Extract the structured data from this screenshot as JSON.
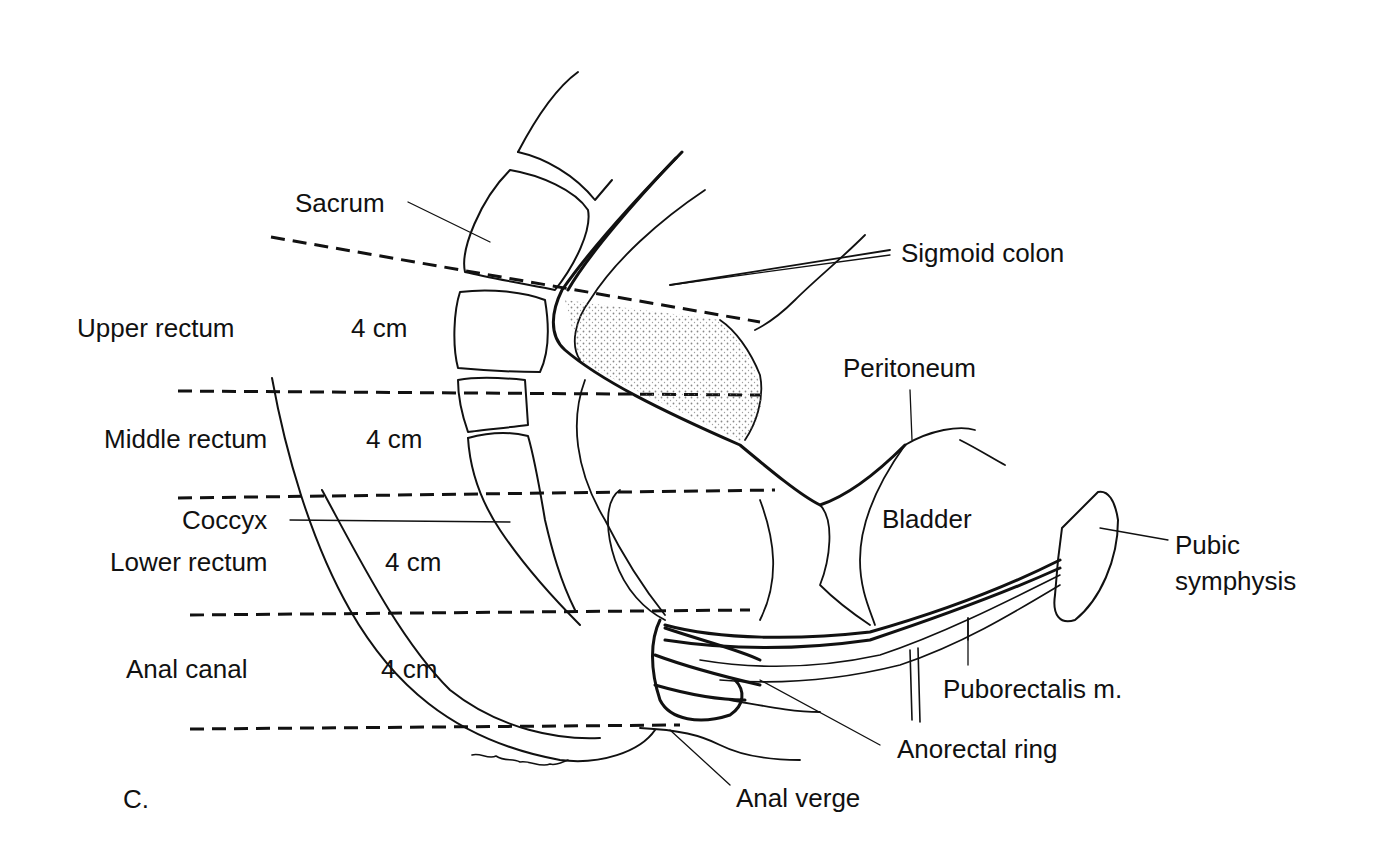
{
  "figure": {
    "panel_letter": "C.",
    "signature": "Stenmann"
  },
  "segments": [
    {
      "name": "Upper rectum",
      "length": "4 cm"
    },
    {
      "name": "Middle rectum",
      "length": "4 cm"
    },
    {
      "name": "Lower rectum",
      "length": "4 cm"
    },
    {
      "name": "Anal canal",
      "length": "4 cm"
    }
  ],
  "labels": {
    "sacrum": "Sacrum",
    "sigmoid_colon": "Sigmoid colon",
    "peritoneum": "Peritoneum",
    "bladder": "Bladder",
    "coccyx": "Coccyx",
    "pubic_symphysis_line1": "Pubic",
    "pubic_symphysis_line2": "symphysis",
    "puborectalis": "Puborectalis m.",
    "anorectal_ring": "Anorectal ring",
    "anal_verge": "Anal verge"
  },
  "colors": {
    "ink": "#111111",
    "background": "#ffffff",
    "stipple": "#555555"
  }
}
